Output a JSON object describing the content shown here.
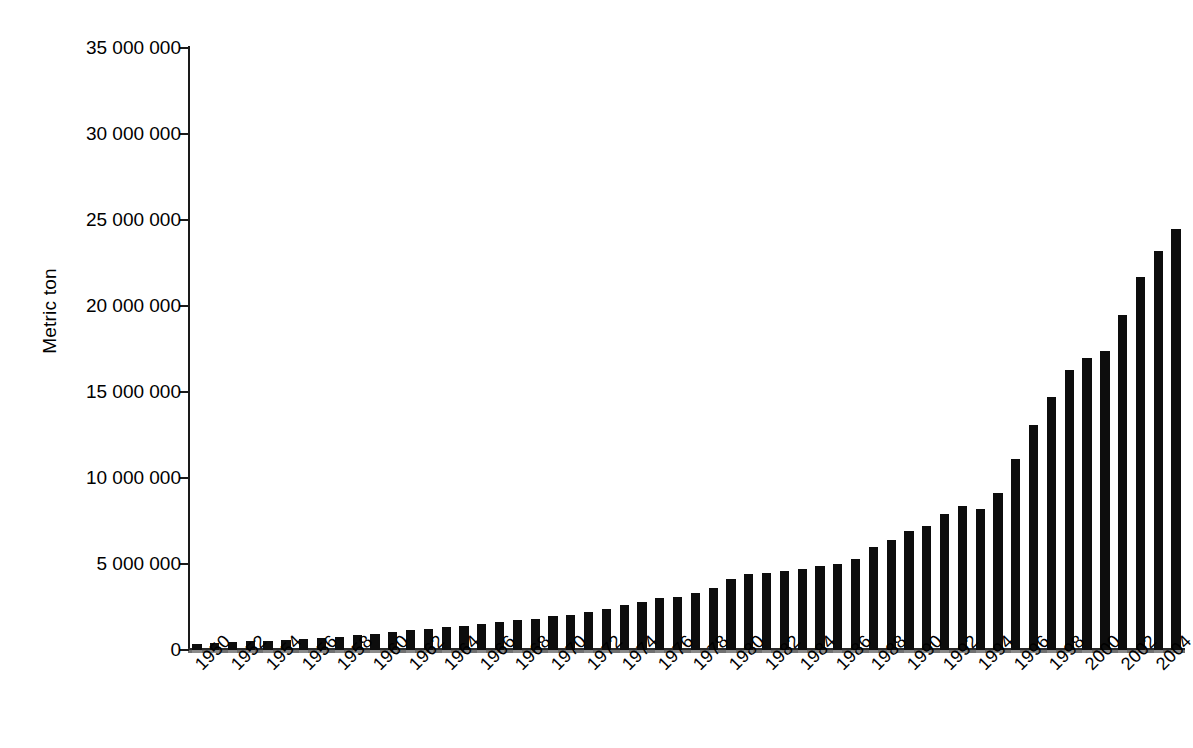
{
  "chart_data": {
    "type": "bar",
    "title": "",
    "subtitle": "",
    "xlabel": "",
    "ylabel": "Metric ton",
    "ylim": [
      0,
      35000000
    ],
    "ytick_values": [
      0,
      5000000,
      10000000,
      15000000,
      20000000,
      25000000,
      30000000,
      35000000
    ],
    "ytick_labels": [
      "0",
      "5 000 000",
      "10 000 000",
      "15 000 000",
      "20 000 000",
      "25 000 000",
      "30 000 000",
      "35 000 000"
    ],
    "grid": false,
    "legend": null,
    "bar_color": "#0d0d0d",
    "xtick_label_rotation_deg": -45,
    "xtick_label_interval_years": 2,
    "xtick_labels": [
      "1950",
      "1952",
      "1954",
      "1956",
      "1958",
      "1960",
      "1962",
      "1964",
      "1966",
      "1968",
      "1970",
      "1972",
      "1974",
      "1976",
      "1978",
      "1980",
      "1982",
      "1984",
      "1986",
      "1988",
      "1990",
      "1992",
      "1994",
      "1996",
      "1998",
      "2000",
      "2002",
      "2004"
    ],
    "categories": [
      "1950",
      "1951",
      "1952",
      "1953",
      "1954",
      "1955",
      "1956",
      "1957",
      "1958",
      "1959",
      "1960",
      "1961",
      "1962",
      "1963",
      "1964",
      "1965",
      "1966",
      "1967",
      "1968",
      "1969",
      "1970",
      "1971",
      "1972",
      "1973",
      "1974",
      "1975",
      "1976",
      "1977",
      "1978",
      "1979",
      "1980",
      "1981",
      "1982",
      "1983",
      "1984",
      "1985",
      "1986",
      "1987",
      "1988",
      "1989",
      "1990",
      "1991",
      "1992",
      "1993",
      "1994",
      "1995",
      "1996",
      "1997",
      "1998",
      "1999",
      "2000",
      "2001",
      "2002",
      "2003",
      "2004",
      "2005"
    ],
    "values": [
      350000,
      400000,
      450000,
      500000,
      550000,
      600000,
      620000,
      680000,
      750000,
      850000,
      950000,
      1050000,
      1150000,
      1250000,
      1350000,
      1400000,
      1500000,
      1600000,
      1750000,
      1800000,
      1950000,
      2050000,
      2200000,
      2400000,
      2600000,
      2800000,
      3000000,
      3100000,
      3300000,
      3600000,
      4100000,
      4400000,
      4450000,
      4600000,
      4700000,
      4900000,
      5000000,
      5300000,
      6000000,
      6400000,
      6900000,
      7200000,
      7900000,
      8400000,
      8200000,
      9100000,
      11100000,
      13100000,
      14700000,
      16300000,
      17000000,
      17400000,
      19500000,
      21700000,
      23200000,
      24500000
    ],
    "values_note": "Bar heights read off the y-axis (0 – 35 000 000 metric ton), estimated between 5 000 000 gridlines."
  }
}
